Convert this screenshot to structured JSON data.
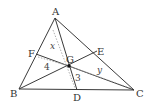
{
  "diagram": {
    "type": "triangle-medians-centroid",
    "points": {
      "A": {
        "label": "A",
        "x": 55,
        "y": 18
      },
      "B": {
        "label": "B",
        "x": 19,
        "y": 89
      },
      "C": {
        "label": "C",
        "x": 134,
        "y": 90
      },
      "D": {
        "label": "D",
        "x": 77,
        "y": 90
      },
      "E": {
        "label": "E",
        "x": 97,
        "y": 51
      },
      "F": {
        "label": "F",
        "x": 36,
        "y": 54
      },
      "G": {
        "label": "G",
        "x": 69,
        "y": 66
      }
    },
    "segment_labels": {
      "x": "x",
      "y": "y",
      "four": "4",
      "three": "3"
    },
    "colors": {
      "line": "#3a3a3a",
      "dotted": "#9a9a9a",
      "text": "#333333"
    }
  }
}
